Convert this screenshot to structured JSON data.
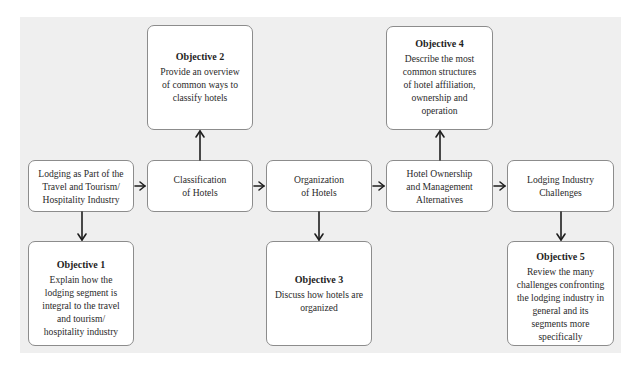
{
  "diagram": {
    "steps": [
      {
        "id": "lodging-travel-tourism",
        "label": "Lodging as Part of the\nTravel and Tourism/\nHospitality Industry"
      },
      {
        "id": "classification",
        "label": "Classification\nof Hotels"
      },
      {
        "id": "organization",
        "label": "Organization\nof Hotels"
      },
      {
        "id": "ownership-management",
        "label": "Hotel Ownership\nand Management\nAlternatives"
      },
      {
        "id": "industry-challenges",
        "label": "Lodging Industry\nChallenges"
      }
    ],
    "objectives": [
      {
        "title": "Objective 1",
        "text": "Explain how the\nlodging segment is\nintegral to the travel\nand tourism/\nhospitality industry",
        "linked_step": "lodging-travel-tourism",
        "position": "below"
      },
      {
        "title": "Objective 2",
        "text": "Provide an overview\nof common ways to\nclassify hotels",
        "linked_step": "classification",
        "position": "above"
      },
      {
        "title": "Objective 3",
        "text": "Discuss how hotels are\norganized",
        "linked_step": "organization",
        "position": "below"
      },
      {
        "title": "Objective 4",
        "text": "Describe the most\ncommon structures\nof hotel affiliation,\nownership and\noperation",
        "linked_step": "ownership-management",
        "position": "above"
      },
      {
        "title": "Objective 5",
        "text": "Review the many\nchallenges confronting\nthe lodging industry in\ngeneral and its\nsegments more\nspecifically",
        "linked_step": "industry-challenges",
        "position": "below"
      }
    ],
    "colors": {
      "panel_background": "#efefef",
      "box_background": "#ffffff",
      "box_border": "#8c8c8c",
      "arrow": "#1e1e1e",
      "text": "#2a2a2a"
    }
  }
}
